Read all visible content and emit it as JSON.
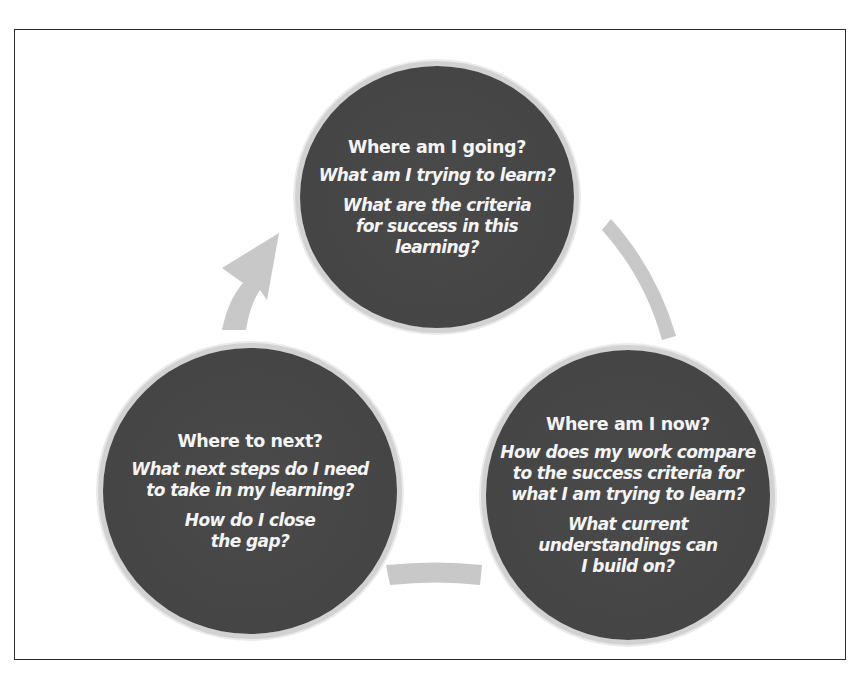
{
  "diagram": {
    "type": "cycle",
    "colors": {
      "circle_fill": "#454545",
      "circle_rim": "#d2d2d2",
      "arrow": "#c8c8c8",
      "text": "#f4f4f4",
      "frame": "#2a2a2a"
    },
    "nodes": [
      {
        "id": "where-am-i-going",
        "heading": "Where am I going?",
        "questions": [
          "What am I trying to learn?",
          "What are the criteria\nfor success in this\nlearning?"
        ]
      },
      {
        "id": "where-am-i-now",
        "heading": "Where am I now?",
        "questions": [
          "How does my work compare\nto the success criteria for\nwhat I am trying to learn?",
          "What current\nunderstandings can\nI build on?"
        ]
      },
      {
        "id": "where-to-next",
        "heading": "Where to next?",
        "questions": [
          "What next steps do I need\nto take in my learning?",
          "How do I close\nthe gap?"
        ]
      }
    ],
    "edges": [
      {
        "from": "where-am-i-going",
        "to": "where-am-i-now",
        "style": "arc"
      },
      {
        "from": "where-am-i-now",
        "to": "where-to-next",
        "style": "arc"
      },
      {
        "from": "where-to-next",
        "to": "where-am-i-going",
        "style": "arc-arrowhead"
      }
    ]
  }
}
